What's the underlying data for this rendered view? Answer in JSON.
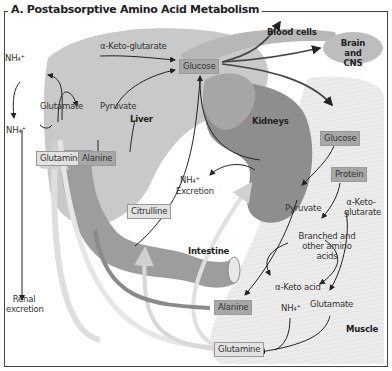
{
  "title": "A. Postabsorptive Amino Acid Metabolism",
  "colors": {
    "liver": "#c9c9c9",
    "kidney": "#8e8e8e",
    "intestine": "#9d9d9d",
    "muscle": "#e6e6e6",
    "brain": "#bdbdbd",
    "box_dark": "#a8a8a8",
    "box_light": "#e2e2e2",
    "arrow": "#222222",
    "pale_arrow": "#d8d8d8"
  },
  "organs": {
    "liver": "Liver",
    "kidneys": "Kidneys",
    "intestine": "Intestine",
    "muscle": "Muscle",
    "blood_cells": "Blood cells",
    "brain": "Brain and CNS"
  },
  "liver": {
    "akg": "α-Keto-glutarate",
    "nh4_top": "NH₄⁺",
    "glutamate": "Glutamate",
    "pyruvate": "Pyruvate",
    "nh4_mid": "NH₄⁺",
    "glutamine": "Glutamine",
    "alanine": "Alanine",
    "glucose": "Glucose"
  },
  "kidney": {
    "nh4": "NH₄⁺",
    "excretion": "Excretion",
    "citrulline": "Citrulline"
  },
  "renal": {
    "label": "Renal excretion"
  },
  "muscle": {
    "glucose": "Glucose",
    "protein": "Protein",
    "pyruvate": "Pyruvate",
    "akg": "α-Keto-glutarate",
    "branched": "Branched and other amino acids",
    "keto_acid": "α-Keto acid",
    "alanine": "Alanine",
    "nh4": "NH₄⁺",
    "glutamate": "Glutamate",
    "glutamine": "Glutamine"
  }
}
